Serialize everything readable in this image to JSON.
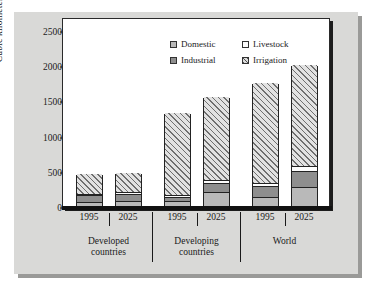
{
  "chart_data": {
    "type": "bar",
    "subtype": "stacked",
    "title": "",
    "xlabel": "",
    "ylabel": "Cubic kilometers",
    "ylim": [
      0,
      2700
    ],
    "yticks": [
      0,
      500,
      1000,
      1500,
      2000,
      2500
    ],
    "ytick_labels": [
      "0",
      "500",
      "1000",
      "1500",
      "2000",
      "2500"
    ],
    "grid": false,
    "legend_position": "top-right",
    "categories": [
      "1995",
      "2025",
      "1995",
      "2025",
      "1995",
      "2025"
    ],
    "groups": [
      {
        "label_line1": "Developed",
        "label_line2": "countries",
        "members": [
          "1995",
          "2025"
        ]
      },
      {
        "label_line1": "Developing",
        "label_line2": "countries",
        "members": [
          "1995",
          "2025"
        ]
      },
      {
        "label_line1": "World",
        "label_line2": "",
        "members": [
          "1995",
          "2025"
        ]
      }
    ],
    "series": [
      {
        "name": "Domestic",
        "color": "#b9b9b9",
        "pattern": "solid",
        "values": [
          50,
          75,
          75,
          195,
          125,
          265
        ]
      },
      {
        "name": "Industrial",
        "color": "#8e8e8e",
        "pattern": "solid",
        "values": [
          105,
          100,
          55,
          130,
          160,
          230
        ]
      },
      {
        "name": "Livestock",
        "color": "#fdfdfd",
        "pattern": "solid",
        "values": [
          20,
          20,
          30,
          50,
          45,
          70
        ]
      },
      {
        "name": "Irrigation",
        "color": "#e2e2e2",
        "pattern": "hatch",
        "values": [
          300,
          295,
          1175,
          1195,
          1430,
          1455
        ]
      }
    ],
    "totals": [
      475,
      490,
      1335,
      1570,
      1760,
      2020
    ]
  },
  "legend": {
    "entries": [
      {
        "label": "Domestic",
        "swatch": "domestic-swatch"
      },
      {
        "label": "Livestock",
        "swatch": "livestock-swatch"
      },
      {
        "label": "Industrial",
        "swatch": "industrial-swatch"
      },
      {
        "label": "Irrigation",
        "swatch": "irrigation-swatch"
      }
    ]
  }
}
